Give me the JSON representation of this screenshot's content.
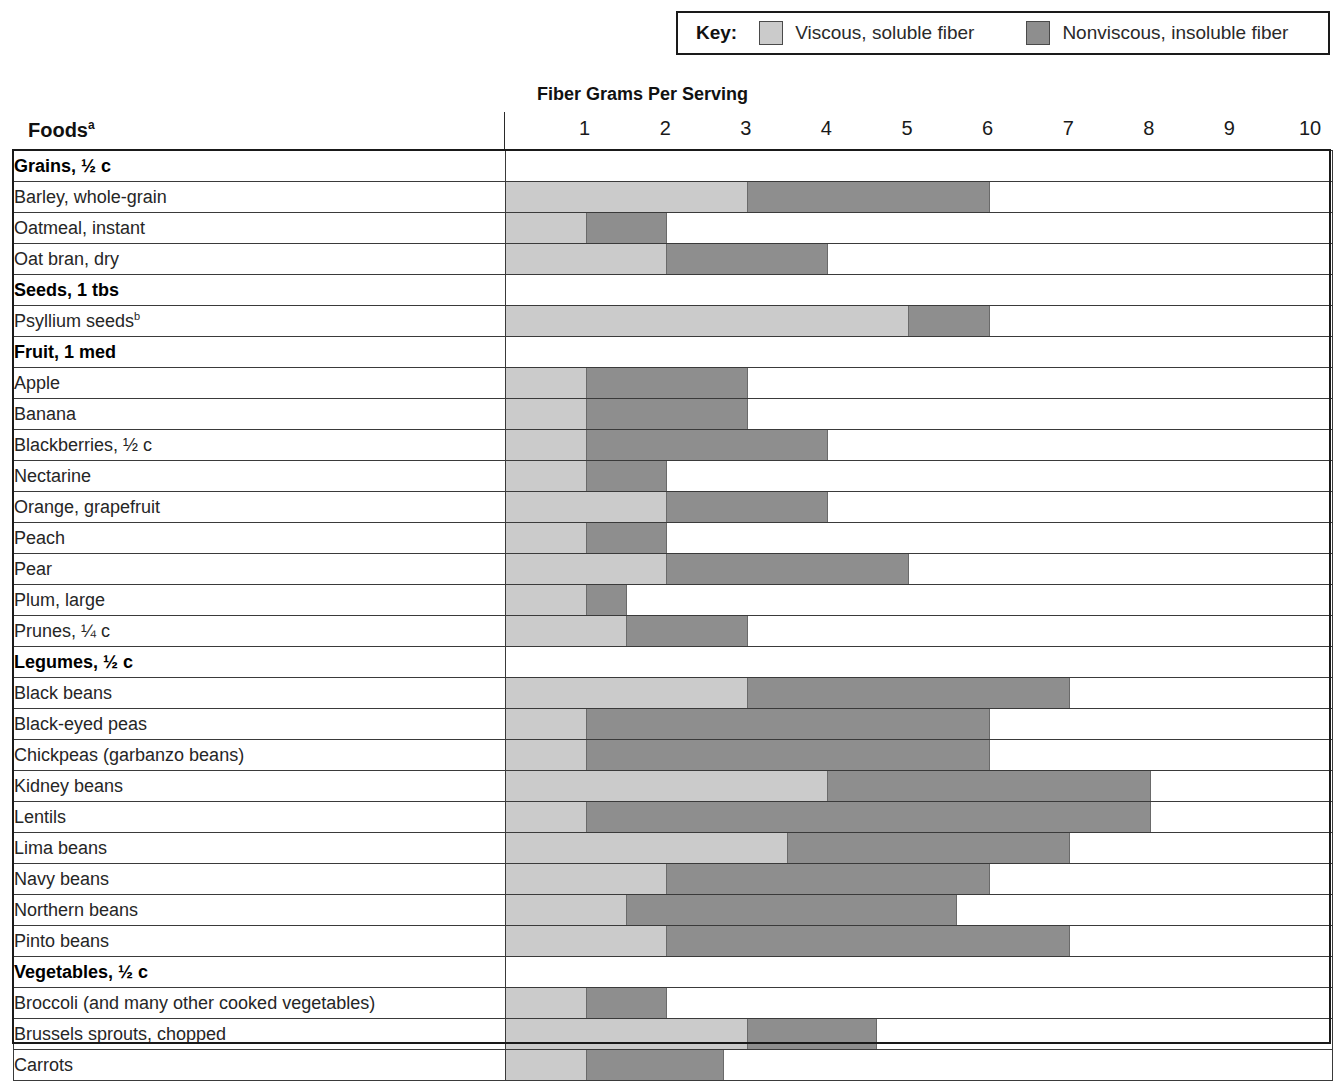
{
  "legend": {
    "key_label": "Key:",
    "entries": [
      {
        "name": "viscous-soluble",
        "label": "Viscous, soluble fiber",
        "color": "#cbcbcb"
      },
      {
        "name": "nonviscous-insoluble",
        "label": "Nonviscous, insoluble fiber",
        "color": "#8e8e8e"
      }
    ]
  },
  "chart_title": "Fiber Grams Per Serving",
  "column_header": "Foods",
  "column_header_superscript": "a",
  "axis": {
    "ticks": [
      1,
      2,
      3,
      4,
      5,
      6,
      7,
      8,
      9,
      10
    ],
    "min": 0,
    "max": 10
  },
  "chart_data": {
    "type": "bar",
    "orientation": "horizontal",
    "stacked": true,
    "title": "Fiber Grams Per Serving",
    "xlabel": "Fiber Grams Per Serving",
    "ylabel": "Foods",
    "xlim": [
      0,
      10
    ],
    "grid": false,
    "legend_position": "top-right",
    "series": [
      {
        "name": "Viscous, soluble fiber",
        "color": "#cbcbcb"
      },
      {
        "name": "Nonviscous, insoluble fiber",
        "color": "#8e8e8e"
      }
    ],
    "groups": [
      {
        "group": "Grains, ½ c",
        "rows": [
          {
            "label": "Barley, whole-grain",
            "soluble": 3.0,
            "insoluble": 3.0,
            "total": 6.0
          },
          {
            "label": "Oatmeal, instant",
            "soluble": 1.0,
            "insoluble": 1.0,
            "total": 2.0
          },
          {
            "label": "Oat bran, dry",
            "soluble": 2.0,
            "insoluble": 2.0,
            "total": 4.0
          }
        ]
      },
      {
        "group": "Seeds, 1 tbs",
        "rows": [
          {
            "label": "Psyllium seeds",
            "superscript": "b",
            "soluble": 5.0,
            "insoluble": 1.0,
            "total": 6.0
          }
        ]
      },
      {
        "group": "Fruit, 1 med",
        "rows": [
          {
            "label": "Apple",
            "soluble": 1.0,
            "insoluble": 2.0,
            "total": 3.0
          },
          {
            "label": "Banana",
            "soluble": 1.0,
            "insoluble": 2.0,
            "total": 3.0
          },
          {
            "label": "Blackberries, ½ c",
            "soluble": 1.0,
            "insoluble": 3.0,
            "total": 4.0
          },
          {
            "label": "Nectarine",
            "soluble": 1.0,
            "insoluble": 1.0,
            "total": 2.0
          },
          {
            "label": "Orange, grapefruit",
            "soluble": 2.0,
            "insoluble": 2.0,
            "total": 4.0
          },
          {
            "label": "Peach",
            "soluble": 1.0,
            "insoluble": 1.0,
            "total": 2.0
          },
          {
            "label": "Pear",
            "soluble": 2.0,
            "insoluble": 3.0,
            "total": 5.0
          },
          {
            "label": "Plum, large",
            "soluble": 1.0,
            "insoluble": 0.5,
            "total": 1.5
          },
          {
            "label": "Prunes, ¼ c",
            "soluble": 1.5,
            "insoluble": 1.5,
            "total": 3.0
          }
        ]
      },
      {
        "group": "Legumes, ½ c",
        "rows": [
          {
            "label": "Black beans",
            "soluble": 3.0,
            "insoluble": 4.0,
            "total": 7.0
          },
          {
            "label": "Black-eyed peas",
            "soluble": 1.0,
            "insoluble": 5.0,
            "total": 6.0
          },
          {
            "label": "Chickpeas (garbanzo beans)",
            "soluble": 1.0,
            "insoluble": 5.0,
            "total": 6.0
          },
          {
            "label": "Kidney beans",
            "soluble": 4.0,
            "insoluble": 4.0,
            "total": 8.0
          },
          {
            "label": "Lentils",
            "soluble": 1.0,
            "insoluble": 7.0,
            "total": 8.0
          },
          {
            "label": "Lima beans",
            "soluble": 3.5,
            "insoluble": 3.5,
            "total": 7.0
          },
          {
            "label": "Navy beans",
            "soluble": 2.0,
            "insoluble": 4.0,
            "total": 6.0
          },
          {
            "label": "Northern beans",
            "soluble": 1.5,
            "insoluble": 4.1,
            "total": 5.6
          },
          {
            "label": "Pinto beans",
            "soluble": 2.0,
            "insoluble": 5.0,
            "total": 7.0
          }
        ]
      },
      {
        "group": "Vegetables, ½ c",
        "rows": [
          {
            "label": "Broccoli (and many other cooked vegetables)",
            "soluble": 1.0,
            "insoluble": 1.0,
            "total": 2.0
          },
          {
            "label": "Brussels sprouts, chopped",
            "soluble": 3.0,
            "insoluble": 1.6,
            "total": 4.6
          },
          {
            "label": "Carrots",
            "soluble": 1.0,
            "insoluble": 1.7,
            "total": 2.7
          }
        ]
      }
    ]
  }
}
